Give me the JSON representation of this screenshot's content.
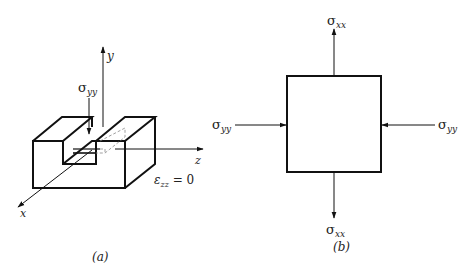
{
  "panel_a": {
    "caption": "(a)",
    "axes": {
      "x": "x",
      "y": "y",
      "z": "z"
    },
    "stress_label": {
      "symbol": "σ",
      "sub": "yy"
    },
    "strain_condition": {
      "symbol": "ε",
      "sub": "zz",
      "rest": " = 0"
    }
  },
  "panel_b": {
    "caption": "(b)",
    "top_label": {
      "symbol": "σ",
      "sub": "xx"
    },
    "bottom_label": {
      "symbol": "σ",
      "sub": "xx"
    },
    "left_label": {
      "symbol": "σ",
      "sub": "yy"
    },
    "right_label": {
      "symbol": "σ",
      "sub": "yy"
    }
  },
  "colors": {
    "line": "#111111",
    "dashed": "#888888",
    "background": "#ffffff"
  }
}
